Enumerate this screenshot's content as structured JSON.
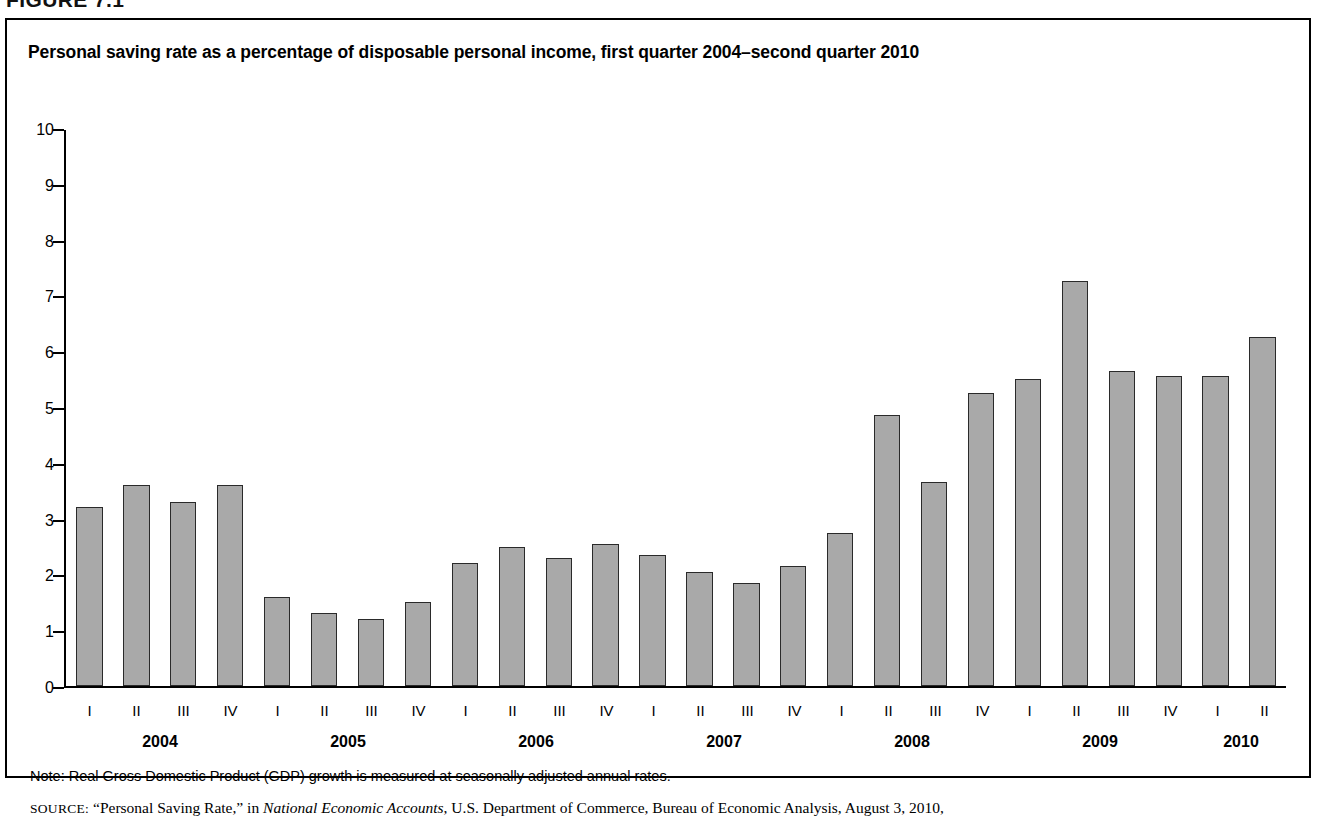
{
  "figure": {
    "number_label": "FIGURE 7.1"
  },
  "chart_title": "Personal saving rate as a percentage of disposable personal income, first quarter 2004–second quarter 2010",
  "notes": {
    "note_label": "Note:",
    "note_text": "Real Gross Domestic Product (GDP) growth is measured at seasonally adjusted annual rates.",
    "note_full": "Note: Real Gross Domestic Product (GDP) growth is measured at seasonally adjusted annual rates.",
    "source_label": "SOURCE:",
    "source_title_quoted": "“Personal Saving Rate,”",
    "source_in": "in",
    "source_publication": "National Economic Accounts",
    "source_rest": ", U.S. Department of Commerce, Bureau of Economic Analysis, August 3, 2010,"
  },
  "colors": {
    "bar_fill": "#a9a9a9",
    "bar_border": "#2a2a2a",
    "axis": "#000000",
    "frame": "#000000",
    "background": "#ffffff"
  },
  "chart_data": {
    "type": "bar",
    "title": "Personal saving rate as a percentage of disposable personal income, first quarter 2004–second quarter 2010",
    "xlabel": "",
    "ylabel": "",
    "ylim": [
      0,
      10
    ],
    "yticks": [
      0,
      1,
      2,
      3,
      4,
      5,
      6,
      7,
      8,
      9,
      10
    ],
    "ytick_labels": [
      "0",
      "1",
      "2",
      "3",
      "4",
      "5",
      "6",
      "7",
      "8",
      "9",
      "10"
    ],
    "grid": false,
    "legend": false,
    "categories": [
      "2004 I",
      "2004 II",
      "2004 III",
      "2004 IV",
      "2005 I",
      "2005 II",
      "2005 III",
      "2005 IV",
      "2006 I",
      "2006 II",
      "2006 III",
      "2006 IV",
      "2007 I",
      "2007 II",
      "2007 III",
      "2007 IV",
      "2008 I",
      "2008 II",
      "2008 III",
      "2008 IV",
      "2009 I",
      "2009 II",
      "2009 III",
      "2009 IV",
      "2010 I",
      "2010 II"
    ],
    "quarter_labels": [
      "I",
      "II",
      "III",
      "IV",
      "I",
      "II",
      "III",
      "IV",
      "I",
      "II",
      "III",
      "IV",
      "I",
      "II",
      "III",
      "IV",
      "I",
      "II",
      "III",
      "IV",
      "I",
      "II",
      "III",
      "IV",
      "I",
      "II"
    ],
    "year_groups": [
      {
        "year": "2004",
        "quarters": 4
      },
      {
        "year": "2005",
        "quarters": 4
      },
      {
        "year": "2006",
        "quarters": 4
      },
      {
        "year": "2007",
        "quarters": 4
      },
      {
        "year": "2008",
        "quarters": 4
      },
      {
        "year": "2009",
        "quarters": 4
      },
      {
        "year": "2010",
        "quarters": 2
      }
    ],
    "values": [
      3.2,
      3.6,
      3.3,
      3.6,
      1.6,
      1.3,
      1.2,
      1.5,
      2.2,
      2.5,
      2.3,
      2.55,
      2.35,
      2.05,
      1.85,
      2.15,
      2.75,
      4.85,
      3.65,
      5.25,
      5.5,
      7.25,
      5.65,
      5.55,
      5.55,
      6.25
    ]
  }
}
